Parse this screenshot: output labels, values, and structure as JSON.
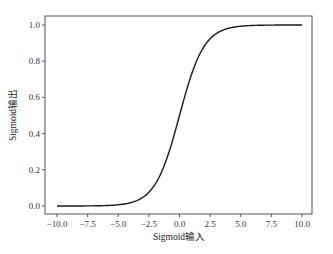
{
  "chart_data": {
    "type": "line",
    "title": "",
    "xlabel": "Sigmoid输入",
    "ylabel": "Sigmoid输出",
    "xlim": [
      -11.0,
      11.0
    ],
    "ylim": [
      -0.05,
      1.05
    ],
    "xticks": [
      -10.0,
      -7.5,
      -5.0,
      -2.5,
      0.0,
      2.5,
      5.0,
      7.5,
      10.0
    ],
    "xtick_labels": [
      "-10.0",
      "-7.5",
      "-5.0",
      "-2.5",
      "0.0",
      "2.5",
      "5.0",
      "7.5",
      "10.0"
    ],
    "yticks": [
      0.0,
      0.2,
      0.4,
      0.6,
      0.8,
      1.0
    ],
    "ytick_labels": [
      "0.0",
      "0.2",
      "0.4",
      "0.6",
      "0.8",
      "1.0"
    ],
    "grid": false,
    "legend": null,
    "series": [
      {
        "name": "sigmoid",
        "function": "1/(1+exp(-x))",
        "x": [
          -10.0,
          -7.5,
          -5.0,
          -4.0,
          -3.0,
          -2.5,
          -2.0,
          -1.5,
          -1.0,
          -0.5,
          0.0,
          0.5,
          1.0,
          1.5,
          2.0,
          2.5,
          3.0,
          4.0,
          5.0,
          7.5,
          10.0
        ],
        "values": [
          0.0,
          0.001,
          0.007,
          0.018,
          0.047,
          0.076,
          0.119,
          0.182,
          0.269,
          0.378,
          0.5,
          0.622,
          0.731,
          0.818,
          0.881,
          0.924,
          0.953,
          0.982,
          0.993,
          0.999,
          1.0
        ],
        "color": "#1a1a1a"
      }
    ]
  }
}
